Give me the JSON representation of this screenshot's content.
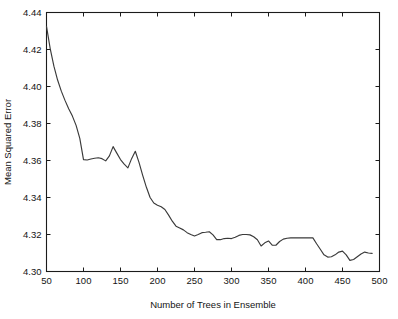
{
  "chart_data": {
    "type": "line",
    "title": "",
    "xlabel": "Number of Trees in Ensemble",
    "ylabel": "Mean Squared Error",
    "xlim": [
      50,
      500
    ],
    "ylim": [
      4.3,
      4.44
    ],
    "xticks": [
      50,
      100,
      150,
      200,
      250,
      300,
      350,
      400,
      450,
      500
    ],
    "yticks": [
      4.3,
      4.32,
      4.34,
      4.36,
      4.38,
      4.4,
      4.42,
      4.44
    ],
    "xtick_labels": [
      "50",
      "100",
      "150",
      "200",
      "250",
      "300",
      "350",
      "400",
      "450",
      "500"
    ],
    "ytick_labels": [
      "4.30",
      "4.32",
      "4.34",
      "4.36",
      "4.38",
      "4.40",
      "4.42",
      "4.44"
    ],
    "grid": false,
    "legend": null,
    "line_color": "#3a3a3a",
    "axis_color": "#1b1b1b",
    "background_color": "#ffffff",
    "series": [
      {
        "name": "Mean Squared Error",
        "x": [
          50,
          55,
          60,
          65,
          70,
          75,
          80,
          85,
          90,
          95,
          100,
          105,
          110,
          115,
          120,
          125,
          130,
          135,
          140,
          145,
          150,
          155,
          160,
          165,
          170,
          175,
          180,
          185,
          190,
          195,
          200,
          205,
          210,
          215,
          220,
          225,
          230,
          235,
          240,
          245,
          250,
          255,
          260,
          265,
          270,
          275,
          280,
          285,
          290,
          295,
          300,
          305,
          310,
          315,
          320,
          325,
          330,
          335,
          340,
          345,
          350,
          355,
          360,
          365,
          370,
          375,
          380,
          385,
          390,
          395,
          400,
          405,
          410,
          415,
          420,
          425,
          430,
          435,
          440,
          445,
          450,
          455,
          460,
          465,
          470,
          475,
          480,
          485,
          490
        ],
        "values": [
          4.4325,
          4.4205,
          4.411,
          4.4035,
          4.3975,
          4.3925,
          4.388,
          4.384,
          4.379,
          4.372,
          4.3605,
          4.3603,
          4.3608,
          4.3612,
          4.3615,
          4.361,
          4.3598,
          4.3625,
          4.3675,
          4.364,
          4.3605,
          4.358,
          4.356,
          4.361,
          4.365,
          4.359,
          4.352,
          4.3455,
          4.34,
          4.337,
          4.3358,
          4.335,
          4.3335,
          4.3305,
          4.3272,
          4.3245,
          4.3235,
          4.3225,
          4.321,
          4.32,
          4.3192,
          4.32,
          4.321,
          4.3212,
          4.3215,
          4.3198,
          4.3172,
          4.3172,
          4.3178,
          4.318,
          4.3178,
          4.3185,
          4.3195,
          4.32,
          4.32,
          4.3198,
          4.3188,
          4.3172,
          4.3138,
          4.3155,
          4.3165,
          4.3142,
          4.3142,
          4.3162,
          4.3175,
          4.318,
          4.3182,
          4.3182,
          4.3182,
          4.3182,
          4.3182,
          4.3182,
          4.3182,
          4.315,
          4.312,
          4.309,
          4.3078,
          4.308,
          4.309,
          4.3105,
          4.311,
          4.309,
          4.306,
          4.3065,
          4.308,
          4.3095,
          4.3105,
          4.31,
          4.3098
        ]
      }
    ]
  }
}
